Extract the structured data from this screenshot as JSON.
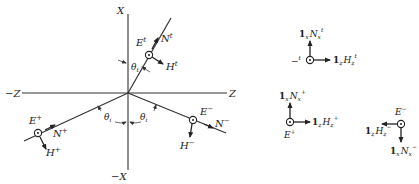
{
  "figure": {
    "axes": {
      "x_pos": "X",
      "x_neg": "−X",
      "z_pos": "Z",
      "z_neg": "−Z"
    },
    "rays": {
      "transmitted": {
        "E": "E",
        "E_sup": "t",
        "N": "N",
        "N_sup": "t",
        "H": "H",
        "H_sup": "t"
      },
      "incident": {
        "E": "E",
        "E_sup": "+",
        "N": "N",
        "N_sup": "+",
        "H": "H",
        "H_sup": "+"
      },
      "reflected": {
        "E": "E",
        "E_sup": "−",
        "N": "N",
        "N_sup": "−",
        "H": "H",
        "H_sup": "−"
      }
    },
    "angles": {
      "transmitted": "θ",
      "transmitted_sub": "t",
      "incident": "θ",
      "incident_sub": "i",
      "reflected": "θ",
      "reflected_sub": "i"
    },
    "insets": {
      "transmitted": {
        "up_prefix": "1",
        "up_prefix_sub": "x",
        "up_label": "N",
        "up_sub": "x",
        "up_sup": "t",
        "right_prefix": "1",
        "right_prefix_sub": "z",
        "right_label": "H",
        "right_sub": "z",
        "right_sup": "t",
        "left_label": "−",
        "left_label2": "E",
        "left_sup": "t"
      },
      "incident": {
        "up_prefix": "1",
        "up_prefix_sub": "x",
        "up_label": "N",
        "up_sub": "x",
        "up_sup": "+",
        "right_prefix": "1",
        "right_prefix_sub": "z",
        "right_label": "H",
        "right_sub": "z",
        "right_sup": "+",
        "bottom_label": "E",
        "bottom_sup": "+"
      },
      "reflected": {
        "top_label": "E",
        "top_sup": "−",
        "left_prefix": "1",
        "left_prefix_sub": "z",
        "left_label": "H",
        "left_sub": "z",
        "left_sup": "−",
        "down_prefix": "1",
        "down_prefix_sub": "x",
        "down_label": "N",
        "down_sub": "x",
        "down_sup": "−"
      }
    }
  }
}
